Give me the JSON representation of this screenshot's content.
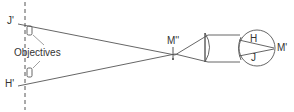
{
  "diagram": {
    "labels": {
      "j_prime": "J'",
      "h_prime": "H'",
      "objectives": "Objectives",
      "m_double_prime": "M''",
      "m_prime": "M'",
      "h": "H",
      "j": "J"
    },
    "colors": {
      "line": "#555555",
      "text": "#333333",
      "background": "#ffffff"
    }
  }
}
